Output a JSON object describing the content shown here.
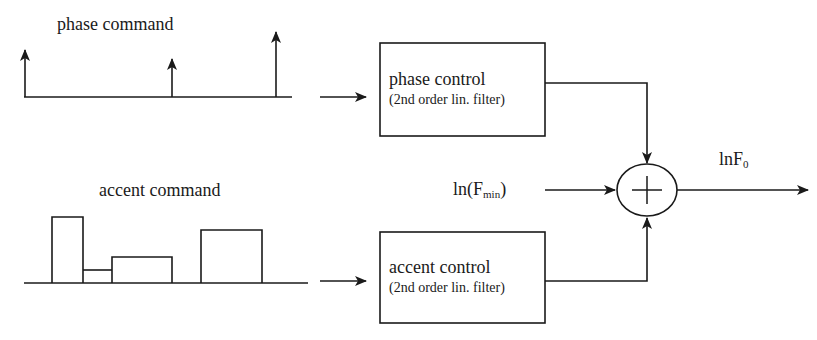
{
  "diagram": {
    "phase_command": {
      "label": "phase command",
      "impulses": [
        {
          "x": 25,
          "top": 48
        },
        {
          "x": 172,
          "top": 57
        },
        {
          "x": 276,
          "top": 30
        }
      ]
    },
    "accent_command": {
      "label": "accent command",
      "pulses": [
        {
          "x1": 52,
          "x2": 83,
          "top": 217
        },
        {
          "x1": 83,
          "x2": 112,
          "top": 270
        },
        {
          "x1": 112,
          "x2": 172,
          "top": 257
        },
        {
          "x1": 201,
          "x2": 262,
          "top": 230
        }
      ]
    },
    "phase_control": {
      "title": "phase control",
      "subtitle": "(2nd order lin. filter)"
    },
    "accent_control": {
      "title": "accent control",
      "subtitle": "(2nd order lin. filter)"
    },
    "baseline_input": {
      "prefix": "ln(F",
      "subscript": "min",
      "suffix": ")"
    },
    "summing_junction": {
      "symbol": "plus"
    },
    "output": {
      "prefix": "lnF",
      "subscript": "0"
    },
    "colors": {
      "stroke": "#1a1a1a",
      "background": "#ffffff"
    }
  }
}
